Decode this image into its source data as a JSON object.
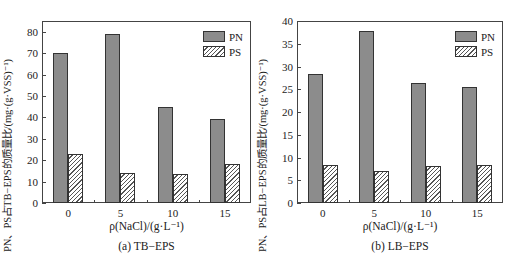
{
  "chart_data": [
    {
      "type": "bar",
      "title": "(a) TB−EPS",
      "xlabel": "ρ(NaCl)/(g·L⁻¹)",
      "ylabel": "PN、PS占TB−EPS的质量比/(mg·(g·VSS)⁻¹)",
      "categories": [
        "0",
        "5",
        "10",
        "15"
      ],
      "series": [
        {
          "name": "PN",
          "values": [
            70,
            79,
            45,
            39
          ]
        },
        {
          "name": "PS",
          "values": [
            23,
            14,
            13.5,
            18
          ]
        }
      ],
      "ylim": [
        0,
        85
      ],
      "yticks": [
        0,
        10,
        20,
        30,
        40,
        50,
        60,
        70,
        80
      ],
      "grid": false,
      "legend_position": "upper right"
    },
    {
      "type": "bar",
      "title": "(b) LB−EPS",
      "xlabel": "ρ(NaCl)/(g·L⁻¹)",
      "ylabel": "PN、PS占LB−EPS的质量比/(mg·(g·VSS)⁻¹)",
      "categories": [
        "0",
        "5",
        "10",
        "15"
      ],
      "series": [
        {
          "name": "PN",
          "values": [
            28.3,
            37.9,
            26.4,
            25.4
          ]
        },
        {
          "name": "PS",
          "values": [
            8.4,
            7.1,
            8.2,
            8.4
          ]
        }
      ],
      "ylim": [
        0,
        40
      ],
      "yticks": [
        0,
        5,
        10,
        15,
        20,
        25,
        30,
        35,
        40
      ],
      "grid": false,
      "legend_position": "upper right"
    }
  ],
  "panels": [
    {
      "ylabel": "PN、PS占TB−EPS的质量比/(mg·(g·VSS)⁻¹)",
      "xlabel": "ρ(NaCl)/(g·L⁻¹)",
      "caption": "(a) TB−EPS",
      "legend": {
        "pn": "PN",
        "ps": "PS"
      }
    },
    {
      "ylabel": "PN、PS占LB−EPS的质量比/(mg·(g·VSS)⁻¹)",
      "xlabel": "ρ(NaCl)/(g·L⁻¹)",
      "caption": "(b) LB−EPS",
      "legend": {
        "pn": "PN",
        "ps": "PS"
      }
    }
  ]
}
